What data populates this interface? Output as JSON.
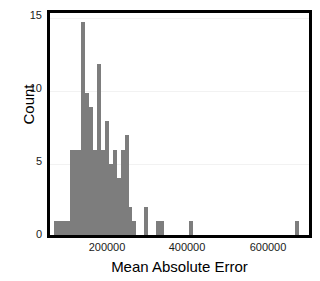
{
  "chart_data": {
    "type": "bar",
    "title": "",
    "subtitle": "",
    "xlabel": "Mean Absolute Error",
    "ylabel": "Count",
    "grid": true,
    "legend": null,
    "bar_color": "#7d7d7d",
    "frame_color": "#000000",
    "background": "#ffffff",
    "xlim": [
      50000,
      710000
    ],
    "ylim": [
      0,
      15.6
    ],
    "xticks": [
      200000,
      400000,
      600000
    ],
    "xtick_labels": [
      "200000",
      "400000",
      "600000"
    ],
    "yticks": [
      0,
      5,
      10,
      15
    ],
    "ytick_labels": [
      "0",
      "5",
      "10",
      "15"
    ],
    "bin_width": 10000,
    "bin_centers": [
      65000,
      75000,
      85000,
      95000,
      105000,
      115000,
      125000,
      135000,
      145000,
      155000,
      165000,
      175000,
      185000,
      195000,
      205000,
      215000,
      225000,
      235000,
      245000,
      255000,
      265000,
      295000,
      325000,
      335000,
      410000,
      680000
    ],
    "categories": [
      "65000",
      "75000",
      "85000",
      "95000",
      "105000",
      "115000",
      "125000",
      "135000",
      "145000",
      "155000",
      "165000",
      "175000",
      "185000",
      "195000",
      "205000",
      "215000",
      "225000",
      "235000",
      "245000",
      "255000",
      "265000",
      "295000",
      "325000",
      "335000",
      "410000",
      "680000"
    ],
    "values": [
      1,
      1,
      1,
      1,
      6,
      6,
      6,
      15,
      10,
      9,
      6,
      12,
      6,
      8,
      5,
      6,
      4,
      6,
      7,
      2,
      1,
      2,
      1,
      1,
      1,
      1
    ]
  }
}
